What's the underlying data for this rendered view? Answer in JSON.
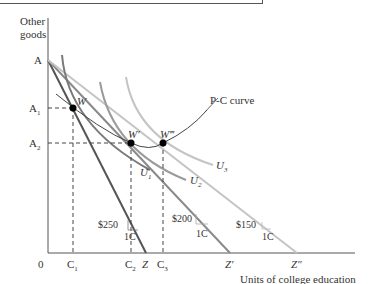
{
  "figure": {
    "axes": {
      "y_label_line1": "Other",
      "y_label_line2": "goods",
      "x_label": "Units of college education",
      "origin": "0"
    },
    "y_ticks": {
      "a": "A",
      "a1": "A",
      "a1_sub": "1",
      "a2": "A",
      "a2_sub": "2"
    },
    "x_ticks": {
      "c1": "C",
      "c1_sub": "1",
      "c2": "C",
      "c2_sub": "2",
      "z": "Z",
      "c3": "C",
      "c3_sub": "3",
      "z1": "Z′",
      "z2": "Z″"
    },
    "points": {
      "w": "W",
      "w1": "W′",
      "w3": "W‴"
    },
    "curves": {
      "pc": "P-C curve",
      "u1": "U",
      "u1_sub": "1",
      "u2": "U",
      "u2_sub": "2",
      "u3": "U",
      "u3_sub": "3"
    },
    "slopes": {
      "s1_price": "$250",
      "s1_unit": "1C",
      "s2_price": "$200",
      "s2_unit": "1C",
      "s3_price": "$150",
      "s3_unit": "1C"
    },
    "colors": {
      "line_dark": "#555555",
      "line_mid": "#8a8a8a",
      "line_light": "#c4c4c4",
      "text": "#333333"
    }
  }
}
